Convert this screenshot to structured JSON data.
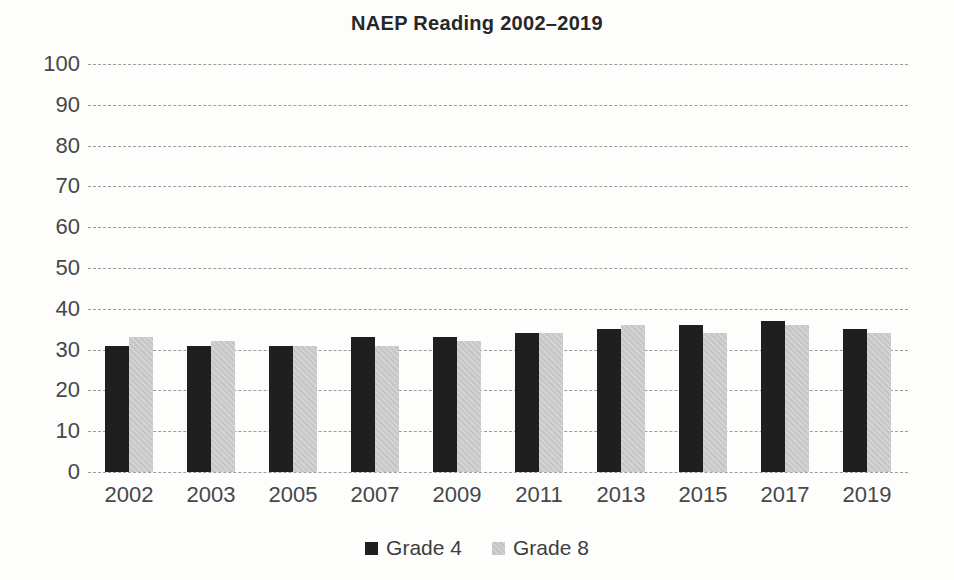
{
  "chart_data": {
    "type": "bar",
    "title": "NAEP Reading 2002–2019",
    "categories": [
      "2002",
      "2003",
      "2005",
      "2007",
      "2009",
      "2011",
      "2013",
      "2015",
      "2017",
      "2019"
    ],
    "series": [
      {
        "name": "Grade 4",
        "color": "#1f1f1f",
        "pattern": "solid",
        "values": [
          31,
          31,
          31,
          33,
          33,
          34,
          35,
          36,
          37,
          35
        ]
      },
      {
        "name": "Grade 8",
        "color": "#c9c9c9",
        "pattern": "hatch",
        "values": [
          33,
          32,
          31,
          31,
          32,
          34,
          36,
          34,
          36,
          34
        ]
      }
    ],
    "xlabel": "",
    "ylabel": "",
    "ylim": [
      0,
      100
    ],
    "yticks": [
      0,
      10,
      20,
      30,
      40,
      50,
      60,
      70,
      80,
      90,
      100
    ],
    "grid": "horizontal-dashed",
    "gridline_color": "#9c9c9c",
    "text_color": "#474747",
    "legend_position": "bottom"
  }
}
